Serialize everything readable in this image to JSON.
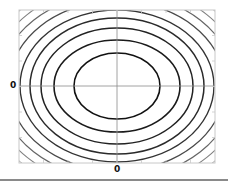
{
  "chart_data": {
    "type": "contour",
    "title": "",
    "xlabel": "",
    "ylabel": "",
    "x_tick_labels": [
      "0"
    ],
    "y_tick_labels": [
      "0"
    ],
    "frame": {
      "left": 19,
      "top": 10,
      "right": 215,
      "bottom": 163
    },
    "center": {
      "x": 117,
      "y": 86
    },
    "contours": [
      {
        "level": 1,
        "rx": 43,
        "ry": 33,
        "color": "#111111",
        "width": 1.6
      },
      {
        "level": 2,
        "rx": 63,
        "ry": 46,
        "color": "#1a1a1a",
        "width": 1.6
      },
      {
        "level": 3,
        "rx": 76,
        "ry": 58,
        "color": "#222222",
        "width": 1.5
      },
      {
        "level": 4,
        "rx": 87,
        "ry": 68,
        "color": "#2a2a2a",
        "width": 1.5
      },
      {
        "level": 5,
        "rx": 97,
        "ry": 76,
        "color": "#333333",
        "width": 1.4
      },
      {
        "level": 6,
        "rx": 108,
        "ry": 85,
        "color": "#4a4a4a",
        "width": 1.3
      },
      {
        "level": 7,
        "rx": 118,
        "ry": 93,
        "color": "#666666",
        "width": 1.2
      },
      {
        "level": 8,
        "rx": 127,
        "ry": 101,
        "color": "#808080",
        "width": 1.1
      },
      {
        "level": 9,
        "rx": 136,
        "ry": 108,
        "color": "#999999",
        "width": 1.0
      },
      {
        "level": 10,
        "rx": 145,
        "ry": 115,
        "color": "#b0b0b0",
        "width": 1.0
      },
      {
        "level": 11,
        "rx": 153,
        "ry": 122,
        "color": "#c4c4c4",
        "width": 0.9
      },
      {
        "level": 12,
        "rx": 161,
        "ry": 129,
        "color": "#d4d4d4",
        "width": 0.9
      }
    ],
    "grid": false,
    "axes_crosshair": true,
    "legend": null
  },
  "labels": {
    "x_zero": "0",
    "y_zero": "0"
  },
  "colors": {
    "frame": "#c8c8c8",
    "crosshair": "#8c8c8c",
    "baseline": "#8a8a8a"
  }
}
